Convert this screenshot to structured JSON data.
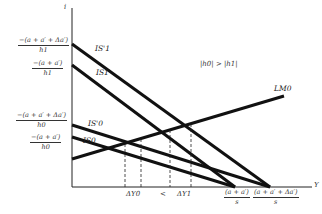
{
  "diagram": {
    "axes": {
      "y_label": "i",
      "x_label": "Y"
    },
    "condition_note": "|h0| > |h1|",
    "curves": {
      "IS1_prime": "IS'1",
      "IS1": "IS1",
      "IS0_prime": "IS'0",
      "IS0": "IS0",
      "LM0": "LM0"
    },
    "y_intercepts": [
      {
        "num": "−(a + a′ + Δa′)",
        "den": "h1"
      },
      {
        "num": "−(a + a′)",
        "den": "h1"
      },
      {
        "num": "−(a + a′ + Δa′)",
        "den": "h0"
      },
      {
        "num": "−(a + a′)",
        "den": "h0"
      }
    ],
    "x_ticks": {
      "dY0": "ΔY0",
      "lt": "<",
      "dY1": "ΔY1",
      "x_int1": {
        "num": "(a + a′)",
        "den": "s"
      },
      "x_int2": {
        "num": "(a + a′ + Δa′)",
        "den": "s"
      }
    },
    "colors": {
      "line": "#111111",
      "background": "#ffffff"
    }
  }
}
